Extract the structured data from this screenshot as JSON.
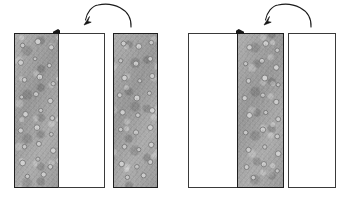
{
  "figure": {
    "background_color": "#ffffff",
    "width": 351,
    "height": 201,
    "colors": {
      "panel_fill_textured": "#a5a5a5",
      "panel_fill_plain": "#ffffff",
      "panel_outline": "#1e1e1e",
      "panel_outline_light": "#3a3a3a",
      "arrow_stroke": "#1a1a1a",
      "marker_fill": "#171717"
    },
    "groups": [
      {
        "name": "left-assembly",
        "panels": [
          {
            "name": "left-textured-panel",
            "fill": "textured",
            "x": 14,
            "y": 33,
            "width": 45,
            "height": 155,
            "label": ""
          },
          {
            "name": "left-plain-panel",
            "fill": "plain",
            "x": 58,
            "y": 33,
            "width": 47,
            "height": 155,
            "label": ""
          },
          {
            "name": "left-detached-textured-panel",
            "fill": "textured",
            "x": 113,
            "y": 33,
            "width": 45,
            "height": 155,
            "label": ""
          }
        ],
        "corner_marker": {
          "name": "left-corner-tab",
          "x": 53,
          "y": 29,
          "width": 7,
          "height": 5
        },
        "arrow": {
          "name": "left-rotation-arrow",
          "direction": "right-to-left",
          "path": "M 131 26 C 131 5, 90 5, 86 21",
          "head_tip": [
            84,
            24
          ]
        }
      },
      {
        "name": "right-assembly",
        "panels": [
          {
            "name": "right-plain-panel-a",
            "fill": "plain",
            "x": 188,
            "y": 33,
            "width": 50,
            "height": 155,
            "label": ""
          },
          {
            "name": "right-textured-panel",
            "fill": "textured",
            "x": 237,
            "y": 33,
            "width": 47,
            "height": 155,
            "label": ""
          },
          {
            "name": "right-plain-panel-b",
            "fill": "plain",
            "x": 288,
            "y": 33,
            "width": 48,
            "height": 155,
            "label": ""
          }
        ],
        "corner_marker": {
          "name": "right-corner-tab",
          "x": 236,
          "y": 29,
          "width": 8,
          "height": 5
        },
        "arrow": {
          "name": "right-rotation-arrow",
          "direction": "right-to-left",
          "path": "M 311 26 C 311 5, 269 5, 265 21",
          "head_tip": [
            263,
            24
          ]
        }
      }
    ],
    "speck_positions": {
      "note": "light circular aggregate specks distributed across textured panels",
      "columns": 3,
      "rows": 9
    }
  }
}
